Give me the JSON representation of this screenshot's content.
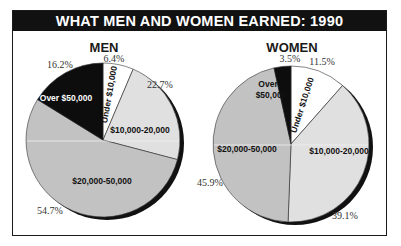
{
  "chart_data": [
    {
      "type": "pie",
      "title": "MEN",
      "start_angle_deg": 0,
      "slices": [
        {
          "label": "Under $10,000",
          "value": 6.4,
          "pct_label": "6.4%",
          "color": "#ffffff",
          "text_color": "#111111"
        },
        {
          "label": "$10,000-20,000",
          "value": 22.7,
          "pct_label": "22.7%",
          "color": "#e0e0e0",
          "text_color": "#111111"
        },
        {
          "label": "$20,000-50,000",
          "value": 54.7,
          "pct_label": "54.7%",
          "color": "#c2c2c2",
          "text_color": "#111111"
        },
        {
          "label": "Over $50,000",
          "value": 16.2,
          "pct_label": "16.2%",
          "color": "#0d0d0d",
          "text_color": "#ffffff"
        }
      ]
    },
    {
      "type": "pie",
      "title": "WOMEN",
      "start_angle_deg": 0,
      "slices": [
        {
          "label": "Under $10,000",
          "value": 11.5,
          "pct_label": "11.5%",
          "color": "#ffffff",
          "text_color": "#111111"
        },
        {
          "label": "$10,000-20,000",
          "value": 39.1,
          "pct_label": "39.1%",
          "color": "#e0e0e0",
          "text_color": "#111111"
        },
        {
          "label": "$20,000-50,000",
          "value": 45.9,
          "pct_label": "45.9%",
          "color": "#c2c2c2",
          "text_color": "#111111"
        },
        {
          "label": "Over $50,000",
          "value": 3.5,
          "pct_label": "3.5%",
          "color": "#0d0d0d",
          "text_color": "#111111"
        }
      ]
    }
  ],
  "header": {
    "title": "WHAT MEN AND WOMEN EARNED: 1990"
  },
  "labels": {
    "men_over_50k": "Over $50,000",
    "women_over_line1": "Over",
    "women_over_line2": "$50,000"
  }
}
